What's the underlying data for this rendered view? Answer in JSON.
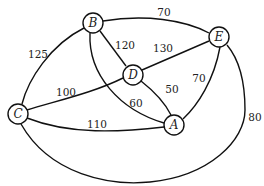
{
  "diagram": {
    "type": "weighted-undirected-graph",
    "nodes": [
      {
        "id": "A",
        "label": "A",
        "x": 174,
        "y": 125
      },
      {
        "id": "B",
        "label": "B",
        "x": 93,
        "y": 23
      },
      {
        "id": "C",
        "label": "C",
        "x": 18,
        "y": 114
      },
      {
        "id": "D",
        "label": "D",
        "x": 133,
        "y": 75
      },
      {
        "id": "E",
        "label": "E",
        "x": 219,
        "y": 37
      }
    ],
    "edges": [
      {
        "from": "B",
        "to": "C",
        "weight": "125"
      },
      {
        "from": "B",
        "to": "E",
        "weight": "70"
      },
      {
        "from": "B",
        "to": "D",
        "weight": "120"
      },
      {
        "from": "D",
        "to": "E",
        "weight": "130"
      },
      {
        "from": "C",
        "to": "D",
        "weight": "100"
      },
      {
        "from": "B",
        "to": "A",
        "weight": "60"
      },
      {
        "from": "D",
        "to": "A",
        "weight": "50"
      },
      {
        "from": "E",
        "to": "A",
        "weight": "70"
      },
      {
        "from": "C",
        "to": "A",
        "weight": "110"
      },
      {
        "from": "C",
        "to": "E",
        "weight": "80"
      }
    ]
  }
}
